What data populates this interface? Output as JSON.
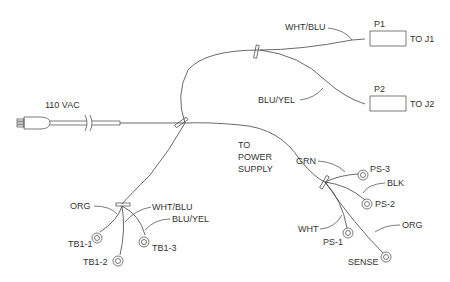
{
  "diagram": {
    "type": "wiring-harness",
    "power_label": "110 VAC",
    "connectors": [
      {
        "id": "P1",
        "to": "TO J1",
        "wire": "WHT/BLU"
      },
      {
        "id": "P2",
        "to": "TO J2",
        "wire": "BLU/YEL"
      }
    ],
    "power_supply_label": [
      "TO",
      "POWER",
      "SUPPLY"
    ],
    "power_supply_wires": [
      {
        "wire": "GRN",
        "terminal": "PS-3"
      },
      {
        "wire": "BLK",
        "terminal": "PS-2"
      },
      {
        "wire": "WHT",
        "terminal": "PS-1"
      },
      {
        "wire": "ORG",
        "terminal": "SENSE"
      }
    ],
    "terminal_block_wires": [
      {
        "wire": "ORG",
        "terminal": "TB1-1"
      },
      {
        "wire": "WHT/BLU",
        "terminal": "TB1-2"
      },
      {
        "wire": "BLU/YEL",
        "terminal": "TB1-3"
      }
    ]
  }
}
